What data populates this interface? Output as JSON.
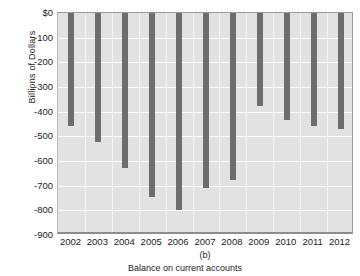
{
  "chart_data": {
    "type": "bar",
    "title": "",
    "subtitle": "",
    "panel_label": "(b)",
    "caption": "Balance on current accounts",
    "xlabel": "",
    "ylabel": "Billions of Dollars",
    "categories": [
      "2002",
      "2003",
      "2004",
      "2005",
      "2006",
      "2007",
      "2008",
      "2009",
      "2010",
      "2011",
      "2012"
    ],
    "values": [
      -458,
      -521,
      -629,
      -745,
      -800,
      -711,
      -678,
      -377,
      -432,
      -460,
      -469
    ],
    "ylim": [
      -900,
      0
    ],
    "ytick_values": [
      0,
      -100,
      -200,
      -300,
      -400,
      -500,
      -600,
      -700,
      -800,
      -900
    ],
    "ytick_labels": [
      "$0",
      "-100",
      "-200",
      "-300",
      "-400",
      "-500",
      "-600",
      "-700",
      "-800",
      "-900"
    ],
    "grid": true,
    "legend": null,
    "series": [
      {
        "name": "Balance on current accounts",
        "color": "#6d6d6d",
        "values": [
          -458,
          -521,
          -629,
          -745,
          -800,
          -711,
          -678,
          -377,
          -432,
          -460,
          -469
        ]
      }
    ],
    "colors": {
      "bar": "#6d6d6d",
      "plot_background": "#e2e2e2",
      "gridline": "#fbfbfb",
      "axis": "#8d8d8d",
      "text": "#1c1c1c",
      "page_background": "#ffffff"
    }
  }
}
